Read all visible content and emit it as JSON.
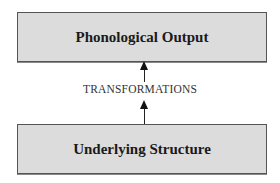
{
  "diagram": {
    "top_box": {
      "label": "Phonological Output"
    },
    "bottom_box": {
      "label": "Underlying Structure"
    },
    "connector": {
      "label": "TRANSFORMATIONS",
      "direction": "upward"
    },
    "colors": {
      "box_fill": "#dcdcdc",
      "box_border": "#555555",
      "arrow": "#111111",
      "text": "#1a1a1a"
    }
  }
}
